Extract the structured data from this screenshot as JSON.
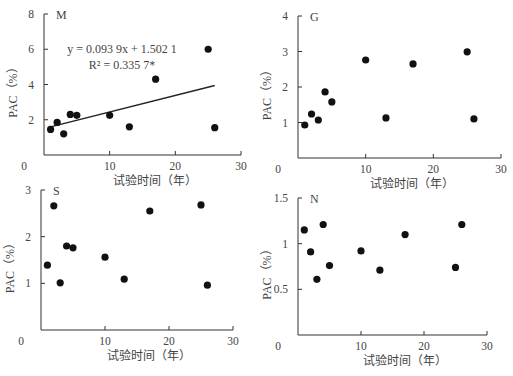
{
  "figure": {
    "xlabel": "试验时间（年）",
    "ylabel": "PAC（%）",
    "point_color": "#111111",
    "axis_color": "#333333"
  },
  "chart_data": [
    {
      "type": "scatter",
      "panel": "M",
      "title": "M",
      "xlabel": "试验时间（年）",
      "ylabel": "PAC（%）",
      "xlim": [
        0,
        30
      ],
      "ylim": [
        0,
        8
      ],
      "xticks": [
        0,
        10,
        20,
        30
      ],
      "yticks": [
        2,
        4,
        6,
        8
      ],
      "x": [
        1,
        2,
        3,
        4,
        5,
        10,
        13,
        17,
        25,
        26
      ],
      "y": [
        1.45,
        1.85,
        1.2,
        2.3,
        2.25,
        2.25,
        1.6,
        4.3,
        6.0,
        1.55
      ],
      "trendline": {
        "slope": 0.0939,
        "intercept": 1.5021,
        "x_range": [
          1,
          26
        ]
      },
      "annotations": [
        "y = 0.093 9x + 1.502 1",
        "R² = 0.335 7*"
      ],
      "grid": false,
      "layout": {
        "x0": 44,
        "x1": 241,
        "y0": 155,
        "y1": 14
      }
    },
    {
      "type": "scatter",
      "panel": "G",
      "title": "G",
      "xlabel": "试验时间（年）",
      "ylabel": "PAC（%）",
      "xlim": [
        0,
        30
      ],
      "ylim": [
        0,
        4
      ],
      "xticks": [
        0,
        10,
        20,
        30
      ],
      "yticks": [
        1,
        2,
        3,
        4
      ],
      "x": [
        1,
        2,
        3,
        4,
        5,
        10,
        13,
        17,
        25,
        26
      ],
      "y": [
        0.93,
        1.24,
        1.07,
        1.86,
        1.58,
        2.76,
        1.13,
        2.65,
        2.99,
        1.1
      ],
      "grid": false,
      "layout": {
        "x0": 298,
        "x1": 501,
        "y0": 158,
        "y1": 16
      }
    },
    {
      "type": "scatter",
      "panel": "S",
      "title": "S",
      "xlabel": "试验时间（年）",
      "ylabel": "PAC（%）",
      "xlim": [
        0,
        30
      ],
      "ylim": [
        0,
        3
      ],
      "xticks": [
        0,
        10,
        20,
        30
      ],
      "yticks": [
        1,
        2,
        3
      ],
      "x": [
        1,
        2,
        3,
        4,
        5,
        10,
        13,
        17,
        25,
        26
      ],
      "y": [
        1.39,
        2.66,
        1.01,
        1.8,
        1.76,
        1.56,
        1.09,
        2.55,
        2.68,
        0.96
      ],
      "grid": false,
      "layout": {
        "x0": 41,
        "x1": 233,
        "y0": 330,
        "y1": 190
      }
    },
    {
      "type": "scatter",
      "panel": "N",
      "title": "N",
      "xlabel": "试验时间（年）",
      "ylabel": "PAC（%）",
      "xlim": [
        0,
        30
      ],
      "ylim": [
        0,
        1.5
      ],
      "xticks": [
        0,
        10,
        20,
        30
      ],
      "yticks": [
        0.5,
        1,
        1.5
      ],
      "x": [
        1,
        2,
        3,
        4,
        5,
        10,
        13,
        17,
        25,
        26
      ],
      "y": [
        1.15,
        0.91,
        0.61,
        1.21,
        0.76,
        0.92,
        0.71,
        1.1,
        0.74,
        1.21
      ],
      "grid": false,
      "layout": {
        "x0": 298,
        "x1": 487,
        "y0": 335,
        "y1": 198
      }
    }
  ]
}
